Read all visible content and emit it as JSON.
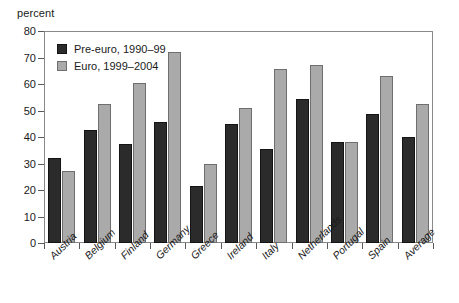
{
  "chart_data": {
    "type": "bar",
    "title": "",
    "xlabel": "",
    "ylabel": "percent",
    "ylim": [
      0,
      80
    ],
    "ytick_step": 10,
    "yticks": [
      0,
      10,
      20,
      30,
      40,
      50,
      60,
      70,
      80
    ],
    "grid": false,
    "legend_position": "inside-top-left",
    "categories": [
      "Austria",
      "Belgium",
      "Finland",
      "Germany",
      "Greece",
      "Ireland",
      "Italy",
      "Netherlands",
      "Portugal",
      "Spain",
      "Average"
    ],
    "series": [
      {
        "name": "Pre-euro, 1990–99",
        "color": "#2b2b2b",
        "values": [
          32,
          42.5,
          37.5,
          45.5,
          21.5,
          45,
          35.5,
          54.5,
          38,
          48.5,
          40
        ]
      },
      {
        "name": "Euro, 1999–2004",
        "color": "#aaaaaa",
        "values": [
          27,
          52.5,
          60.5,
          72,
          30,
          51,
          65.5,
          67,
          38,
          63,
          52.5
        ]
      }
    ]
  },
  "axis": {
    "y_title": "percent"
  },
  "legend": {
    "items": [
      {
        "label": "Pre-euro, 1990–99"
      },
      {
        "label": "Euro, 1999–2004"
      }
    ]
  }
}
